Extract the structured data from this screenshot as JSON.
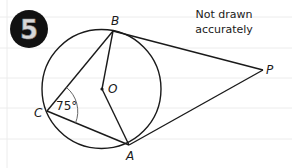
{
  "question": {
    "number": "5",
    "note_line1": "Not drawn",
    "note_line2": "accurately"
  },
  "diagram": {
    "points": {
      "B": {
        "label": "B"
      },
      "O": {
        "label": "O"
      },
      "C": {
        "label": "C"
      },
      "A": {
        "label": "A"
      },
      "P": {
        "label": "P"
      }
    },
    "angle_C": {
      "value": "75",
      "unit": "°",
      "display": "75°"
    }
  },
  "colors": {
    "ink": "#1a1a1a",
    "ruled_lines": "#ececec",
    "badge_bg": "#111111",
    "badge_digit": "#d8d8d8"
  }
}
